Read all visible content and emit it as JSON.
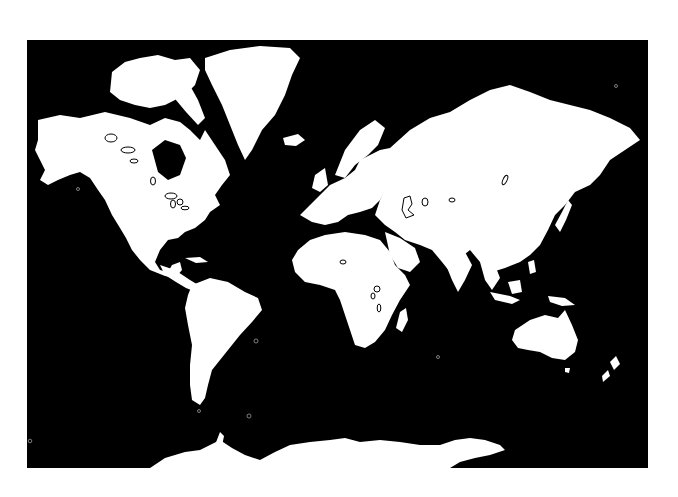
{
  "map": {
    "style": "black ocean, white land, world mercator outline",
    "ocean_color": "#000000",
    "land_color": "#ffffff",
    "frame": {
      "x": 27,
      "y": 40,
      "width": 621,
      "height": 428
    },
    "regions": [
      "North America",
      "Greenland",
      "Canadian Arctic Archipelago",
      "South America",
      "Europe",
      "Africa",
      "Madagascar",
      "Asia",
      "Arabia",
      "India",
      "Southeast Asia",
      "Japan",
      "Indonesia",
      "Australia",
      "New Zealand",
      "Antarctica",
      "Iceland",
      "British Isles"
    ]
  }
}
